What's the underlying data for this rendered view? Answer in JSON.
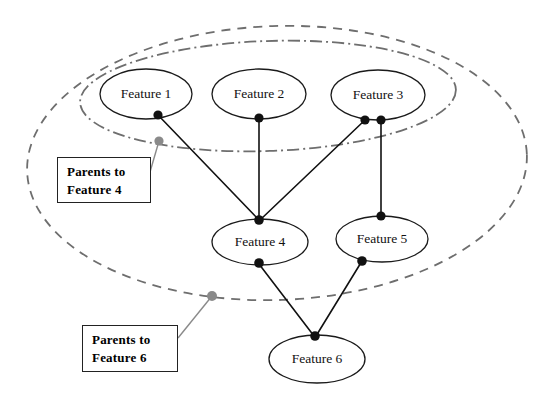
{
  "diagram": {
    "canvas": {
      "width": 546,
      "height": 402,
      "background": "#ffffff"
    },
    "colors": {
      "node_stroke": "#1a1a1a",
      "node_fill": "#ffffff",
      "edge": "#111111",
      "group_stroke": "#6e6e6e",
      "anchor": "#8a8a8a",
      "callout_border": "#222222",
      "text": "#000000"
    },
    "nodes": [
      {
        "id": "feature1",
        "label": "Feature 1",
        "cx": 146,
        "cy": 94,
        "rx": 46,
        "ry": 25
      },
      {
        "id": "feature2",
        "label": "Feature 2",
        "cx": 259,
        "cy": 94,
        "rx": 47,
        "ry": 25
      },
      {
        "id": "feature3",
        "label": "Feature 3",
        "cx": 378,
        "cy": 95,
        "rx": 47,
        "ry": 25
      },
      {
        "id": "feature4",
        "label": "Feature 4",
        "cx": 260,
        "cy": 242,
        "rx": 48,
        "ry": 23
      },
      {
        "id": "feature5",
        "label": "Feature 5",
        "cx": 382,
        "cy": 239,
        "rx": 46,
        "ry": 23
      },
      {
        "id": "feature6",
        "label": "Feature 6",
        "cx": 317,
        "cy": 359,
        "rx": 48,
        "ry": 24
      }
    ],
    "edges": [
      {
        "id": "edge-f1-f4",
        "from": "feature1",
        "to": "feature4",
        "x1": 158,
        "y1": 115,
        "x2": 259,
        "y2": 220
      },
      {
        "id": "edge-f2-f4",
        "from": "feature2",
        "to": "feature4",
        "x1": 259,
        "y1": 118,
        "x2": 259,
        "y2": 220
      },
      {
        "id": "edge-f3-f4",
        "from": "feature3",
        "to": "feature4",
        "x1": 365,
        "y1": 120,
        "x2": 260,
        "y2": 220
      },
      {
        "id": "edge-f3-f5",
        "from": "feature3",
        "to": "feature5",
        "x1": 381,
        "y1": 120,
        "x2": 381,
        "y2": 216
      },
      {
        "id": "edge-f4-f6",
        "from": "feature4",
        "to": "feature6",
        "x1": 259,
        "y1": 264,
        "x2": 314,
        "y2": 336
      },
      {
        "id": "edge-f5-f6",
        "from": "feature5",
        "to": "feature6",
        "x1": 362,
        "y1": 261,
        "x2": 316,
        "y2": 336
      }
    ],
    "edge_dots": [
      {
        "id": "dot-f1-bottom",
        "cx": 158,
        "cy": 115,
        "r": 4.6
      },
      {
        "id": "dot-f2-bottom",
        "cx": 259,
        "cy": 118,
        "r": 4.6
      },
      {
        "id": "dot-f3-bottom-left",
        "cx": 365,
        "cy": 120,
        "r": 4.6
      },
      {
        "id": "dot-f3-bottom-right",
        "cx": 381,
        "cy": 120,
        "r": 4.6
      },
      {
        "id": "dot-f4-top",
        "cx": 259,
        "cy": 220,
        "r": 4.8
      },
      {
        "id": "dot-f4-bottom",
        "cx": 259,
        "cy": 263,
        "r": 4.8
      },
      {
        "id": "dot-f5-top",
        "cx": 381,
        "cy": 216,
        "r": 4.6
      },
      {
        "id": "dot-f5-bottom",
        "cx": 362,
        "cy": 261,
        "r": 4.8
      },
      {
        "id": "dot-f6-top",
        "cx": 315,
        "cy": 336,
        "r": 4.8
      }
    ],
    "groups": [
      {
        "id": "parents-to-feature-6",
        "style": "dashed",
        "cx": 277,
        "cy": 163,
        "rx": 250,
        "ry": 137,
        "rotation": -2
      },
      {
        "id": "parents-to-feature-4",
        "style": "dash-dot",
        "cx": 268,
        "cy": 96,
        "rx": 188,
        "ry": 55,
        "rotation": -2
      }
    ],
    "callouts": [
      {
        "id": "callout-feature-4",
        "lines": [
          "Parents to",
          "Feature 4"
        ],
        "box": {
          "left": 57,
          "top": 157,
          "width": 94,
          "height": 46
        },
        "anchor_dot": {
          "cx": 159,
          "cy": 141,
          "r": 4.6
        },
        "leader": {
          "x1": 159,
          "y1": 141,
          "x2": 150,
          "y2": 172
        }
      },
      {
        "id": "callout-feature-6",
        "lines": [
          "Parents to",
          "Feature 6"
        ],
        "box": {
          "left": 82,
          "top": 325,
          "width": 96,
          "height": 47
        },
        "anchor_dot": {
          "cx": 212,
          "cy": 296,
          "r": 5.0
        },
        "leader": {
          "x1": 212,
          "y1": 296,
          "x2": 178,
          "y2": 338
        }
      }
    ]
  }
}
